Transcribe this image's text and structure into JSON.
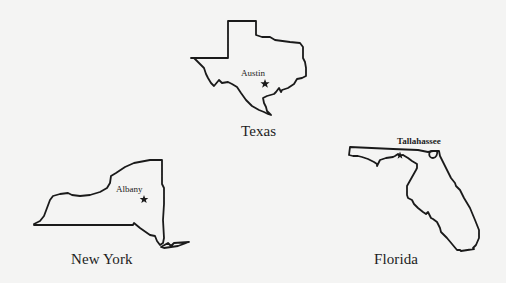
{
  "figure": {
    "type": "state outlines with capitals",
    "states": [
      {
        "name": "Texas",
        "capital": "Austin",
        "capital_marker": "star-icon"
      },
      {
        "name": "New York",
        "capital": "Albany",
        "capital_marker": "star-icon"
      },
      {
        "name": "Florida",
        "capital": "Tallahassee",
        "capital_marker": "star-icon"
      }
    ]
  }
}
